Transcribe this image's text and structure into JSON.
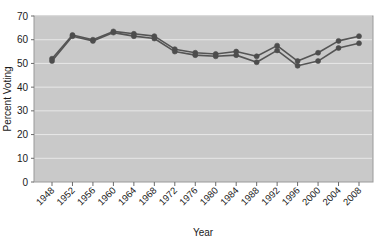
{
  "chart_data": {
    "type": "line",
    "title": "",
    "subtitle": "",
    "xlabel": "Year",
    "ylabel": "Percent Voting",
    "categories": [
      1948,
      1952,
      1956,
      1960,
      1964,
      1968,
      1972,
      1976,
      1980,
      1984,
      1988,
      1992,
      1996,
      2000,
      2004,
      2008
    ],
    "x": [
      1948,
      1952,
      1956,
      1960,
      1964,
      1968,
      1972,
      1976,
      1980,
      1984,
      1988,
      1992,
      1996,
      2000,
      2004,
      2008
    ],
    "xtick_labels": [
      "1948",
      "1952",
      "1956",
      "1960",
      "1964",
      "1968",
      "1972",
      "1976",
      "1980",
      "1984",
      "1988",
      "1992",
      "1996",
      "2000",
      "2004",
      "2008"
    ],
    "ytick_labels": [
      "0",
      "10",
      "20",
      "30",
      "40",
      "50",
      "60",
      "70"
    ],
    "yticks": [
      0,
      10,
      20,
      30,
      40,
      50,
      60,
      70
    ],
    "ylim": [
      0,
      70
    ],
    "xlim": [
      1948,
      2008
    ],
    "grid": true,
    "grid_axis": "y",
    "legend": false,
    "legend_position": "none",
    "series": [
      {
        "name": "series-upper",
        "color": "#555555",
        "marker": "circle",
        "values": [
          52.0,
          62.0,
          60.0,
          63.5,
          62.5,
          61.5,
          56.0,
          54.5,
          54.0,
          55.0,
          53.0,
          57.5,
          51.0,
          54.5,
          59.5,
          61.5
        ]
      },
      {
        "name": "series-lower",
        "color": "#555555",
        "marker": "circle",
        "values": [
          51.0,
          61.5,
          59.5,
          63.0,
          61.5,
          60.5,
          55.0,
          53.5,
          53.0,
          53.5,
          50.5,
          55.5,
          49.0,
          51.0,
          56.5,
          58.5
        ]
      }
    ]
  },
  "axes": {
    "ylabel": "Percent Voting",
    "xlabel": "Year"
  },
  "style": {
    "plot_background": "#c9c9c9",
    "grid_color": "#e8e8e8",
    "line_color": "#555555",
    "marker_color": "#4d4d4d",
    "text_color": "#1a1a1a",
    "figure_background": "#ffffff"
  }
}
